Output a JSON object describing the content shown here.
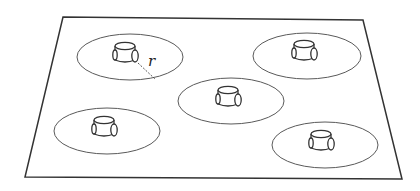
{
  "diagram": {
    "plane": {
      "corners": [
        [
          63,
          17
        ],
        [
          363,
          20
        ],
        [
          402,
          179
        ],
        [
          25,
          177
        ]
      ],
      "stroke": "#333333"
    },
    "range_stroke": "#5a5a5a",
    "robot_stroke": "#333333",
    "radius_label": "r",
    "regions": [
      {
        "id": "robot-1",
        "cx": 130,
        "cy": 57,
        "rx": 53,
        "ry": 23,
        "has_radius_marker": true
      },
      {
        "id": "robot-2",
        "cx": 307,
        "cy": 56,
        "rx": 54,
        "ry": 23,
        "has_radius_marker": false
      },
      {
        "id": "robot-3",
        "cx": 231,
        "cy": 101,
        "rx": 53,
        "ry": 23,
        "has_radius_marker": false
      },
      {
        "id": "robot-4",
        "cx": 107,
        "cy": 131,
        "rx": 53,
        "ry": 23,
        "has_radius_marker": false
      },
      {
        "id": "robot-5",
        "cx": 325,
        "cy": 145,
        "rx": 53,
        "ry": 23,
        "has_radius_marker": false
      }
    ]
  }
}
